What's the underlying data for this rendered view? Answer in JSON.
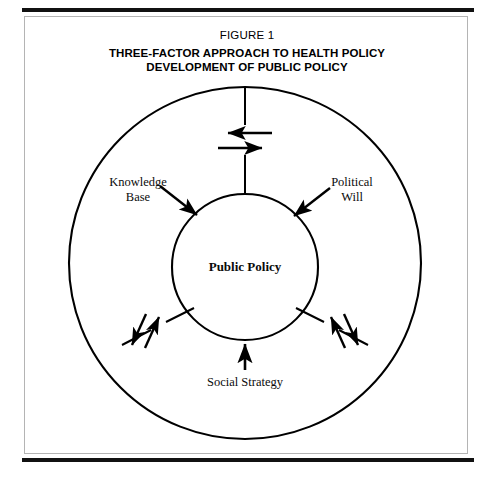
{
  "figure": {
    "number_label": "FIGURE 1",
    "title_line1": "THREE-FACTOR APPROACH TO HEALTH POLICY",
    "title_line2": "DEVELOPMENT OF PUBLIC POLICY"
  },
  "diagram": {
    "type": "concentric-circle-influence-diagram",
    "center_node": {
      "label": "Public Policy",
      "shape": "circle"
    },
    "outer_ring": {
      "shape": "circle",
      "label": ""
    },
    "factors": [
      {
        "id": "knowledge-base",
        "label_line1": "Knowledge",
        "label_line2": "Base",
        "position": "upper-left",
        "arrow_direction": "points-to-center"
      },
      {
        "id": "political-will",
        "label_line1": "Political",
        "label_line2": "Will",
        "position": "upper-right",
        "arrow_direction": "points-to-center"
      },
      {
        "id": "social-strategy",
        "label_line1": "Social Strategy",
        "label_line2": "",
        "position": "bottom-center",
        "arrow_direction": "points-to-center"
      }
    ],
    "connectors": [
      {
        "id": "connector-top",
        "position": "top",
        "exchange_arrows": [
          "left",
          "right"
        ]
      },
      {
        "id": "connector-lower-left",
        "position": "lower-left",
        "exchange_arrows": [
          "up-right",
          "down-left"
        ]
      },
      {
        "id": "connector-lower-right",
        "position": "lower-right",
        "exchange_arrows": [
          "up-right",
          "down-left"
        ]
      }
    ],
    "colors": {
      "ink": "#000000",
      "rule": "#111111",
      "box_border": "#b4b4b4",
      "background": "#ffffff"
    }
  }
}
